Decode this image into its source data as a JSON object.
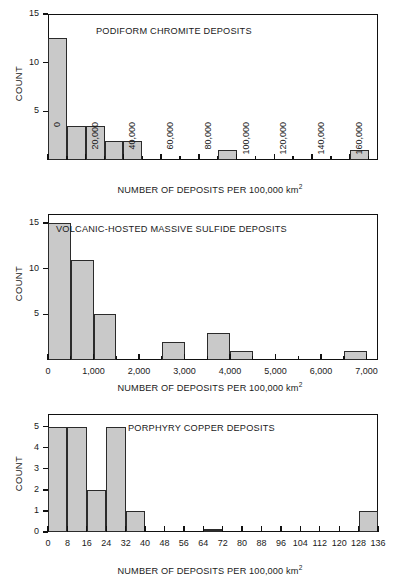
{
  "figure": {
    "background": "#ffffff",
    "bar_fill": "#c9c9c9",
    "bar_stroke": "#2b2b2b",
    "axis_color": "#111111",
    "axis_caption": "NUMBER OF DEPOSITS PER 100,000 km",
    "axis_caption_sup": "2",
    "ylabel": "COUNT"
  },
  "chart_data": [
    {
      "id": "podiform-chromite",
      "type": "bar",
      "title": "PODIFORM CHROMITE DEPOSITS",
      "xlabel": "NUMBER OF DEPOSITS PER 100,000 km2",
      "ylabel": "COUNT",
      "xlim": [
        0,
        175000
      ],
      "ylim": [
        0,
        15
      ],
      "bin_width": 10000,
      "grid": false,
      "legend": null,
      "xticks": [
        0,
        20000,
        40000,
        60000,
        80000,
        100000,
        120000,
        140000,
        160000
      ],
      "xtick_labels": [
        "0",
        "20,000",
        "40,000",
        "60,000",
        "80,000",
        "100,000",
        "120,000",
        "140,000",
        "160,000"
      ],
      "xminor_ticks": [
        10000,
        30000,
        50000,
        70000,
        90000,
        110000,
        130000,
        150000,
        170000
      ],
      "yticks": [
        5,
        10,
        15
      ],
      "ytick_labels": [
        "5",
        "10",
        "15"
      ],
      "bins": [
        {
          "x0": 0,
          "x1": 10000,
          "count": 12.5
        },
        {
          "x0": 10000,
          "x1": 20000,
          "count": 3.5
        },
        {
          "x0": 20000,
          "x1": 30000,
          "count": 3.5
        },
        {
          "x0": 30000,
          "x1": 40000,
          "count": 2
        },
        {
          "x0": 40000,
          "x1": 50000,
          "count": 2
        },
        {
          "x0": 90000,
          "x1": 100000,
          "count": 1
        },
        {
          "x0": 160000,
          "x1": 170000,
          "count": 1
        }
      ]
    },
    {
      "id": "volcanic-hosted-massive-sulfide",
      "type": "bar",
      "title": "VOLCANIC-HOSTED MASSIVE SULFIDE DEPOSITS",
      "xlabel": "NUMBER OF DEPOSITS PER 100,000 km2",
      "ylabel": "COUNT",
      "xlim": [
        0,
        7250
      ],
      "ylim": [
        0,
        16
      ],
      "bin_width": 500,
      "grid": false,
      "legend": null,
      "xticks": [
        0,
        1000,
        2000,
        3000,
        4000,
        5000,
        6000,
        7000
      ],
      "xtick_labels": [
        "0",
        "1,000",
        "2,000",
        "3,000",
        "4,000",
        "5,000",
        "6,000",
        "7,000"
      ],
      "xminor_ticks": [
        500,
        1500,
        2500,
        3500,
        4500,
        5500,
        6500
      ],
      "yticks": [
        5,
        10,
        15
      ],
      "ytick_labels": [
        "5",
        "10",
        "15"
      ],
      "bins": [
        {
          "x0": 0,
          "x1": 500,
          "count": 15
        },
        {
          "x0": 500,
          "x1": 1000,
          "count": 11
        },
        {
          "x0": 1000,
          "x1": 1500,
          "count": 5
        },
        {
          "x0": 2500,
          "x1": 3000,
          "count": 2
        },
        {
          "x0": 3500,
          "x1": 4000,
          "count": 3
        },
        {
          "x0": 4000,
          "x1": 4500,
          "count": 1
        },
        {
          "x0": 6500,
          "x1": 7000,
          "count": 1
        }
      ]
    },
    {
      "id": "porphyry-copper",
      "type": "bar",
      "title": "PORPHYRY COPPER DEPOSITS",
      "xlabel": "NUMBER OF DEPOSITS PER 100,000 km2",
      "ylabel": "COUNT",
      "xlim": [
        0,
        136
      ],
      "ylim": [
        0,
        5.6
      ],
      "bin_width": 8,
      "grid": false,
      "legend": null,
      "xticks": [
        0,
        8,
        16,
        24,
        32,
        40,
        48,
        56,
        64,
        72,
        80,
        88,
        96,
        104,
        112,
        120,
        128,
        136
      ],
      "xtick_labels": [
        "0",
        "8",
        "16",
        "24",
        "32",
        "40",
        "48",
        "56",
        "64",
        "72",
        "80",
        "88",
        "96",
        "104",
        "112",
        "120",
        "128",
        "136"
      ],
      "xminor_ticks": [],
      "yticks": [
        0,
        1,
        2,
        3,
        4,
        5
      ],
      "ytick_labels": [
        "0",
        "1",
        "2",
        "3",
        "4",
        "5"
      ],
      "bins": [
        {
          "x0": 0,
          "x1": 8,
          "count": 5
        },
        {
          "x0": 8,
          "x1": 16,
          "count": 5
        },
        {
          "x0": 16,
          "x1": 24,
          "count": 2
        },
        {
          "x0": 24,
          "x1": 32,
          "count": 5
        },
        {
          "x0": 32,
          "x1": 40,
          "count": 1
        },
        {
          "x0": 64,
          "x1": 72,
          "count": 0
        },
        {
          "x0": 128,
          "x1": 136,
          "count": 1
        }
      ]
    }
  ]
}
